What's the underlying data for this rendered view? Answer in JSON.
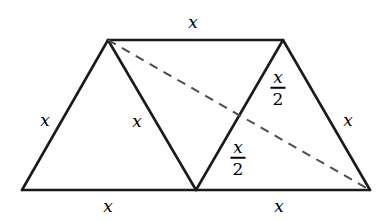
{
  "figure": {
    "type": "geometry-diagram",
    "background_color": "#ffffff",
    "stroke_color": "#1a1a1a",
    "dashed_stroke_color": "#555555",
    "canvas": {
      "width": 388,
      "height": 222
    },
    "vertices": {
      "bottom_left": {
        "x": 22,
        "y": 190
      },
      "bottom_mid": {
        "x": 196,
        "y": 190
      },
      "bottom_right": {
        "x": 370,
        "y": 190
      },
      "top_left": {
        "x": 108,
        "y": 40
      },
      "top_right": {
        "x": 283,
        "y": 40
      },
      "midpoint_right_inner": {
        "x": 240,
        "y": 115
      }
    },
    "solid_edges": [
      {
        "name": "base-left",
        "from": "bottom_left",
        "to": "bottom_mid"
      },
      {
        "name": "base-right",
        "from": "bottom_mid",
        "to": "bottom_right"
      },
      {
        "name": "top",
        "from": "top_left",
        "to": "top_right"
      },
      {
        "name": "left-slant",
        "from": "bottom_left",
        "to": "top_left"
      },
      {
        "name": "inner-left-slant",
        "from": "top_left",
        "to": "bottom_mid"
      },
      {
        "name": "inner-right-slant",
        "from": "bottom_mid",
        "to": "top_right"
      },
      {
        "name": "right-slant",
        "from": "top_right",
        "to": "bottom_right"
      }
    ],
    "dashed_edges": [
      {
        "name": "diagonal",
        "from": "top_left",
        "to": "bottom_right"
      }
    ],
    "labels": [
      {
        "name": "top-side-label",
        "text": "x",
        "kind": "plain",
        "x": 193,
        "y": 22
      },
      {
        "name": "left-side-label",
        "text": "x",
        "kind": "plain",
        "x": 45,
        "y": 120
      },
      {
        "name": "inner-left-label",
        "text": "x",
        "kind": "plain",
        "x": 137,
        "y": 121
      },
      {
        "name": "right-side-label",
        "text": "x",
        "kind": "plain",
        "x": 348,
        "y": 120
      },
      {
        "name": "base-left-label",
        "text": "x",
        "kind": "plain",
        "x": 108,
        "y": 206
      },
      {
        "name": "base-right-label",
        "text": "x",
        "kind": "plain",
        "x": 279,
        "y": 206
      },
      {
        "name": "upper-half-label",
        "numerator": "x",
        "denominator": "2",
        "kind": "fraction",
        "x": 278,
        "y": 88
      },
      {
        "name": "lower-half-label",
        "numerator": "x",
        "denominator": "2",
        "kind": "fraction",
        "x": 238,
        "y": 158
      }
    ]
  }
}
